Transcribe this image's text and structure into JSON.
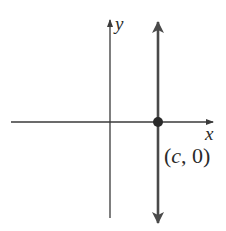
{
  "diagram": {
    "type": "coordinate-plane",
    "axes": {
      "x_label": "x",
      "y_label": "y"
    },
    "vertical_line": {
      "description": "vertical line x = c",
      "point_label_open": "(",
      "point_label_var": "c",
      "point_label_rest": ", 0)",
      "point": "(c, 0)"
    },
    "colors": {
      "axis": "#3a3a3a",
      "line": "#4a4a4a",
      "point": "#2a2a2a"
    }
  }
}
